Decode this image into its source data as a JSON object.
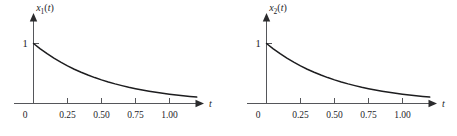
{
  "figure": {
    "panel_count": 2,
    "background_color": "#ffffff",
    "axis_color": "#55565a",
    "curve_color": "#1d1d1f",
    "text_color": "#1d1d1f"
  },
  "panels": [
    {
      "id": "panel-left",
      "ylabel_base": "x",
      "ylabel_sub": "1",
      "ylabel_arg": "(t)",
      "xlabel": "t",
      "origin_label": "0",
      "unit_label": "1",
      "tick_labels": [
        "0.25",
        "0.50",
        "0.75",
        "1.00"
      ]
    },
    {
      "id": "panel-right",
      "ylabel_base": "x",
      "ylabel_sub": "2",
      "ylabel_arg": "(t)",
      "xlabel": "t",
      "origin_label": "0",
      "unit_label": "1",
      "tick_labels": [
        "0.25",
        "0.50",
        "0.75",
        "1.00"
      ]
    }
  ],
  "chart_data": [
    {
      "type": "line",
      "title": "",
      "xlabel": "t",
      "ylabel": "x1(t)",
      "xlim": [
        0,
        1.3
      ],
      "ylim": [
        0,
        1.08
      ],
      "xticks": [
        0.25,
        0.5,
        0.75,
        1.0
      ],
      "xticklabels": [
        "0.25",
        "0.50",
        "0.75",
        "1.00"
      ],
      "yticks": [
        1
      ],
      "yticklabels": [
        "1"
      ],
      "grid": false,
      "legend": false,
      "series": [
        {
          "name": "x1(t)",
          "x": [
            0.0,
            0.05,
            0.1,
            0.15,
            0.2,
            0.25,
            0.3,
            0.35,
            0.4,
            0.45,
            0.5,
            0.55,
            0.6,
            0.65,
            0.7,
            0.75,
            0.8,
            0.85,
            0.9,
            0.95,
            1.0,
            1.05,
            1.1,
            1.15,
            1.2
          ],
          "y": [
            1.0,
            0.911,
            0.83,
            0.756,
            0.689,
            0.627,
            0.571,
            0.521,
            0.474,
            0.432,
            0.394,
            0.359,
            0.327,
            0.298,
            0.271,
            0.247,
            0.225,
            0.205,
            0.187,
            0.17,
            0.155,
            0.141,
            0.129,
            0.117,
            0.107
          ]
        }
      ]
    },
    {
      "type": "line",
      "title": "",
      "xlabel": "t",
      "ylabel": "x2(t)",
      "xlim": [
        0,
        1.3
      ],
      "ylim": [
        0,
        1.08
      ],
      "xticks": [
        0.25,
        0.5,
        0.75,
        1.0
      ],
      "xticklabels": [
        "0.25",
        "0.50",
        "0.75",
        "1.00"
      ],
      "yticks": [
        1
      ],
      "yticklabels": [
        "1"
      ],
      "grid": false,
      "legend": false,
      "series": [
        {
          "name": "x2(t)",
          "x": [
            0.0,
            0.05,
            0.1,
            0.15,
            0.2,
            0.25,
            0.3,
            0.35,
            0.4,
            0.45,
            0.5,
            0.55,
            0.6,
            0.65,
            0.7,
            0.75,
            0.8,
            0.85,
            0.9,
            0.95,
            1.0,
            1.05,
            1.1,
            1.15,
            1.2
          ],
          "y": [
            1.0,
            0.911,
            0.83,
            0.756,
            0.689,
            0.627,
            0.571,
            0.521,
            0.474,
            0.432,
            0.394,
            0.359,
            0.327,
            0.298,
            0.271,
            0.247,
            0.225,
            0.205,
            0.187,
            0.17,
            0.155,
            0.141,
            0.129,
            0.117,
            0.107
          ]
        }
      ]
    }
  ]
}
